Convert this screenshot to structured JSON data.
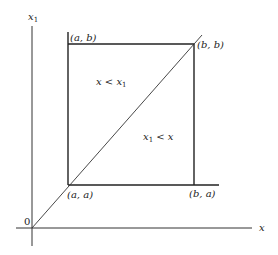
{
  "diagram": {
    "axes": {
      "x_label": "x",
      "y_label_base": "x",
      "y_label_sub": "1",
      "origin_label": "0"
    },
    "corners": {
      "top_left": "(a, b)",
      "top_right": "(b, b)",
      "bottom_left": "(a, a)",
      "bottom_right": "(b, a)"
    },
    "regions": {
      "upper_left": {
        "lhs": "x",
        "op": " < ",
        "rhs_base": "x",
        "rhs_sub": "1"
      },
      "lower_right": {
        "lhs_base": "x",
        "lhs_sub": "1",
        "op": " < ",
        "rhs": "x"
      }
    },
    "colors": {
      "line": "#222222",
      "background": "#ffffff"
    }
  }
}
